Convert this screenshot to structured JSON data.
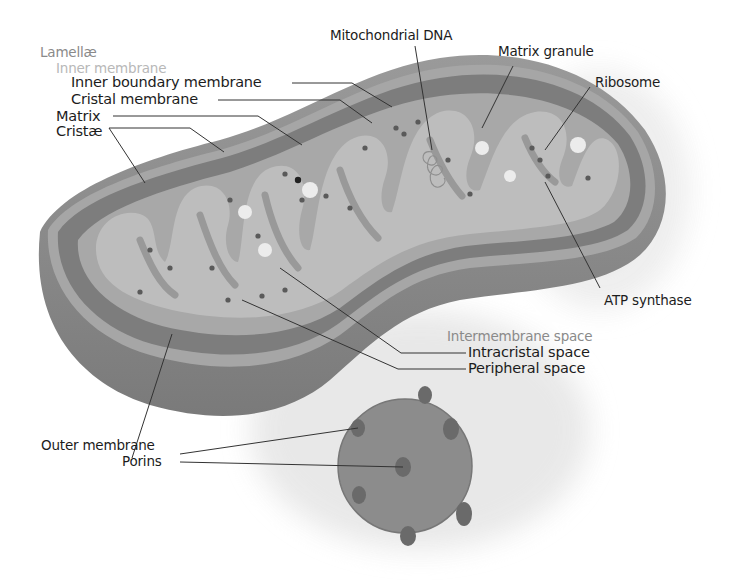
{
  "diagram": {
    "colors": {
      "background": "#ffffff",
      "outer_membrane": "#8f8f8f",
      "outer_membrane_dark": "#6f6f6f",
      "intermembrane": "#7d7d7d",
      "inner_rim": "#a4a4a4",
      "matrix": "#bdbdbd",
      "matrix_granule": "#ececec",
      "ribosome": "#5a5a5a",
      "porin_disc": "#8c8c8c",
      "porin": "#6a6a6a",
      "shadow": "#e8e8e8",
      "label_text": "#1c1c1c",
      "label_group_text": "#8a8a8a",
      "label_subgroup_text": "#b8b8b8",
      "leader_line": "#333333"
    },
    "labels": {
      "lamellae": "Lamellæ",
      "inner_membrane": "Inner membrane",
      "inner_boundary_membrane": "Inner boundary membrane",
      "cristal_membrane": "Cristal membrane",
      "matrix": "Matrix",
      "cristae": "Cristæ",
      "mitochondrial_dna": "Mitochondrial DNA",
      "matrix_granule": "Matrix granule",
      "ribosome": "Ribosome",
      "atp_synthase": "ATP synthase",
      "intermembrane_space": "Intermembrane space",
      "intracristal_space": "Intracristal space",
      "peripheral_space": "Peripheral space",
      "outer_membrane": "Outer membrane",
      "porins": "Porins"
    }
  }
}
